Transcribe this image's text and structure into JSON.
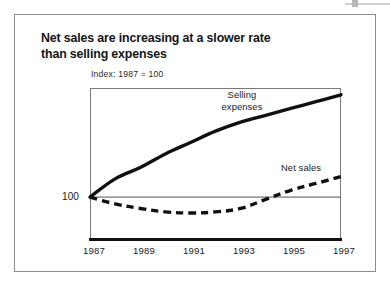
{
  "figure": {
    "title": "Net sales are increasing at a slower rate than selling expenses",
    "title_line1": "Net sales are increasing at a slower rate",
    "title_line2": "than selling expenses",
    "axis_note": "Index: 1987 = 100",
    "y_reference_label": "100",
    "label_selling_line1": "Selling",
    "label_selling_line2": "expenses",
    "label_net_sales": "Net sales",
    "colors": {
      "ink": "#141414",
      "frame": "#8d8d8d",
      "plot_frame": "#7a7a7a",
      "reference_line": "#555555",
      "background": "#ffffff"
    }
  },
  "chart_data": {
    "type": "line",
    "title": "Net sales are increasing at a slower rate than selling expenses",
    "subtitle": "Index: 1987 = 100",
    "xlabel": "",
    "ylabel": "Index: 1987 = 100",
    "grid": false,
    "legend": "inline-annotations",
    "x_tick_labels": [
      "1987",
      "1989",
      "1991",
      "1993",
      "1995",
      "1997"
    ],
    "x": [
      1987,
      1988,
      1989,
      1990,
      1991,
      1992,
      1993,
      1994,
      1995,
      1996,
      1997
    ],
    "xlim": [
      1987,
      1997
    ],
    "ylim": [
      82,
      148
    ],
    "reference_line": 100,
    "series": [
      {
        "name": "Selling expenses",
        "style": "solid",
        "linewidth": "thick",
        "values": [
          100,
          108,
          113,
          119,
          124,
          129,
          133,
          136,
          139,
          142,
          145
        ]
      },
      {
        "name": "Net sales",
        "style": "dashed",
        "linewidth": "thick",
        "values": [
          100,
          97,
          95,
          93.5,
          93,
          93.5,
          95,
          99,
          103,
          106,
          109
        ]
      }
    ]
  }
}
